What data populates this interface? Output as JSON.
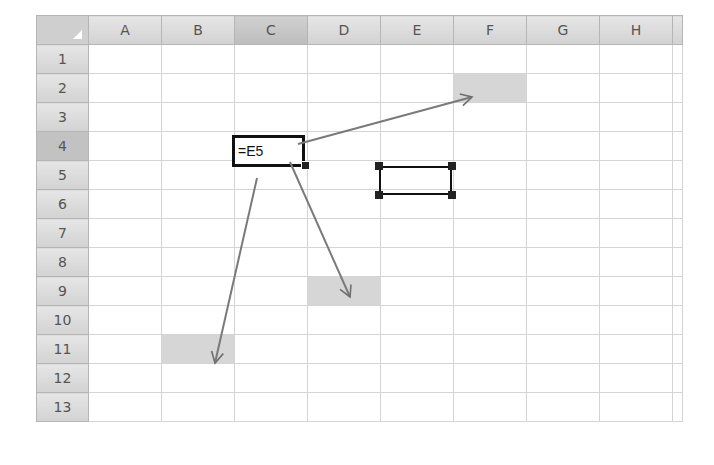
{
  "columns": [
    "A",
    "B",
    "C",
    "D",
    "E",
    "F",
    "G",
    "H"
  ],
  "rows": [
    "1",
    "2",
    "3",
    "4",
    "5",
    "6",
    "7",
    "8",
    "9",
    "10",
    "11",
    "12",
    "13"
  ],
  "selected_column": "C",
  "selected_row": "4",
  "active_cell": {
    "ref": "C4",
    "value": "=E5"
  },
  "referenced_cell": "E5",
  "shaded_cells": [
    "F2",
    "D9",
    "B11"
  ],
  "arrows": [
    {
      "from": "C4",
      "to": "F2"
    },
    {
      "from": "C4",
      "to": "D9"
    },
    {
      "from": "C4",
      "to": "B11"
    }
  ],
  "colors": {
    "shade": "#d6d6d6",
    "arrow": "#777777",
    "header": "#dcdcdc"
  }
}
